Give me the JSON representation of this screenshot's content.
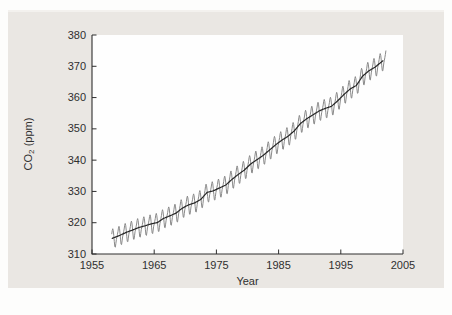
{
  "figure": {
    "page_background": "#fdfdfc",
    "panel_color": "#eae7e3",
    "plot_background": "#fefefe",
    "ink_color": "#2f2f2f"
  },
  "chart_data": {
    "type": "line",
    "title": "",
    "xlabel": "Year",
    "ylabel": {
      "pre": "CO",
      "sub": "2",
      "post": " (ppm)"
    },
    "xlim": [
      1955,
      2005
    ],
    "ylim": [
      310,
      380
    ],
    "xticks": [
      1955,
      1965,
      1975,
      1985,
      1995,
      2005
    ],
    "yticks": [
      310,
      320,
      330,
      340,
      350,
      360,
      370,
      380
    ],
    "grid": false,
    "legend_position": "none",
    "series": [
      {
        "name": "monthly-co2-seasonal",
        "color": "#8a8a8a",
        "stroke_width": 1,
        "kind": "monthly_with_seasonal_cycle",
        "start": 1958.17,
        "end": 2002.33
      },
      {
        "name": "annual-mean-trend",
        "color": "#262626",
        "stroke_width": 1.2,
        "kind": "smoothed_trend",
        "start": 1958.17,
        "end": 2001.9
      }
    ],
    "annual": {
      "years": [
        1958,
        1959,
        1960,
        1961,
        1962,
        1963,
        1964,
        1965,
        1966,
        1967,
        1968,
        1969,
        1970,
        1971,
        1972,
        1973,
        1974,
        1975,
        1976,
        1977,
        1978,
        1979,
        1980,
        1981,
        1982,
        1983,
        1984,
        1985,
        1986,
        1987,
        1988,
        1989,
        1990,
        1991,
        1992,
        1993,
        1994,
        1995,
        1996,
        1997,
        1998,
        1999,
        2000,
        2001
      ],
      "values": [
        315.2,
        315.97,
        316.91,
        317.64,
        318.45,
        318.99,
        319.62,
        320.04,
        321.37,
        322.18,
        323.05,
        324.62,
        325.68,
        326.32,
        327.46,
        329.68,
        330.19,
        331.12,
        332.03,
        333.84,
        335.41,
        336.84,
        338.76,
        340.12,
        341.48,
        343.15,
        344.87,
        346.35,
        347.61,
        349.31,
        351.69,
        353.2,
        354.45,
        355.7,
        356.54,
        357.21,
        358.96,
        360.97,
        362.74,
        363.88,
        366.84,
        368.54,
        369.71,
        371.32
      ]
    },
    "seasonal_anomaly_by_month": [
      -0.2,
      0.6,
      1.4,
      2.5,
      3.0,
      2.3,
      0.7,
      -1.3,
      -3.0,
      -3.2,
      -2.1,
      -0.9
    ]
  }
}
